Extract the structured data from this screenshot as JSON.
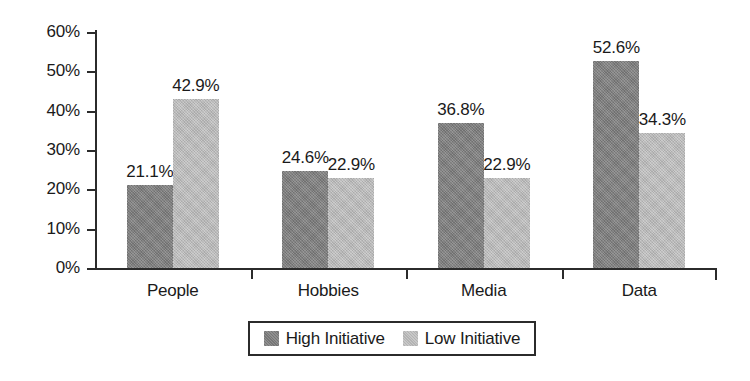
{
  "chart_data": {
    "type": "bar",
    "title": "",
    "subtitle": "",
    "xlabel": "",
    "ylabel": "",
    "categories": [
      "People",
      "Hobbies",
      "Media",
      "Data"
    ],
    "series": [
      {
        "name": "High Initiative",
        "color": "#808080",
        "values": [
          21.1,
          24.6,
          36.8,
          52.6
        ],
        "labels": [
          "21.1%",
          "24.6%",
          "36.8%",
          "52.6%"
        ]
      },
      {
        "name": "Low Initiative",
        "color": "#bdbdbd",
        "values": [
          42.9,
          22.9,
          22.9,
          34.3
        ],
        "labels": [
          "42.9%",
          "22.9%",
          "22.9%",
          "34.3%"
        ]
      }
    ],
    "ylim": [
      0,
      60
    ],
    "ytick_values": [
      60,
      50,
      40,
      30,
      20,
      10,
      0
    ],
    "ytick_labels": [
      "60%",
      "50%",
      "40%",
      "30%",
      "20%",
      "10%",
      "0%"
    ],
    "grid": false,
    "legend_position": "bottom",
    "value_labels_shown": true,
    "axis_color": "#2b2b2b",
    "background_color": "#ffffff"
  },
  "legend": {
    "entries": [
      {
        "label": "High Initiative"
      },
      {
        "label": "Low Initiative"
      }
    ]
  }
}
